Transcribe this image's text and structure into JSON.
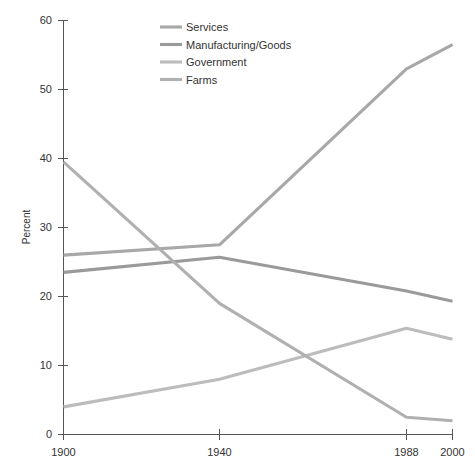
{
  "chart_data": {
    "type": "line",
    "title": "",
    "subtitle": "",
    "xlabel": "",
    "ylabel": "Percent",
    "x": [
      1900,
      1940,
      1988,
      2000
    ],
    "xtick_labels": [
      "1900",
      "1940",
      "1988",
      "2000"
    ],
    "ytick_labels": [
      "0",
      "10",
      "20",
      "30",
      "40",
      "50",
      "60"
    ],
    "ytick_values": [
      0,
      10,
      20,
      30,
      40,
      50,
      60
    ],
    "xlim": [
      1900,
      2000
    ],
    "ylim": [
      0,
      60
    ],
    "grid": false,
    "legend_position": "top-center",
    "series": [
      {
        "name": "Services",
        "color": "#a8a8a8",
        "values": [
          26.0,
          27.5,
          53.0,
          56.5
        ]
      },
      {
        "name": "Manufacturing/Goods",
        "color": "#9a9a9a",
        "values": [
          23.5,
          25.7,
          20.8,
          19.3
        ]
      },
      {
        "name": "Government",
        "color": "#bcbcbc",
        "values": [
          4.0,
          8.0,
          15.4,
          13.8
        ]
      },
      {
        "name": "Farms",
        "color": "#b0b0b0",
        "values": [
          39.5,
          19.0,
          2.5,
          2.0
        ]
      }
    ]
  },
  "legend": {
    "entries": [
      {
        "label": "Services"
      },
      {
        "label": "Manufacturing/Goods"
      },
      {
        "label": "Government"
      },
      {
        "label": "Farms"
      }
    ]
  },
  "axes": {
    "y_title": "Percent"
  }
}
